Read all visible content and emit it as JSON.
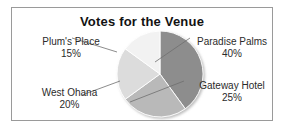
{
  "chart_data": {
    "type": "pie",
    "title": "Votes for the Venue",
    "xlabel": "",
    "ylabel": "",
    "legend_position": "none",
    "grid": false,
    "categories": [
      "Paradise Palms",
      "Gateway Hotel",
      "West Ohana",
      "Plum's Place"
    ],
    "values": [
      40,
      25,
      20,
      15
    ],
    "value_unit": "%",
    "start_angle_deg": 0,
    "direction": "clockwise",
    "slices": [
      {
        "name": "Paradise Palms",
        "value": 40,
        "value_text": "40%",
        "color": "#8d8d8d",
        "start_deg": 0,
        "end_deg": 144
      },
      {
        "name": "Gateway Hotel",
        "value": 25,
        "value_text": "25%",
        "color": "#b9b9b9",
        "start_deg": 144,
        "end_deg": 234
      },
      {
        "name": "West Ohana",
        "value": 20,
        "value_text": "20%",
        "color": "#dcdcdc",
        "start_deg": 234,
        "end_deg": 306
      },
      {
        "name": "Plum's Place",
        "value": 15,
        "value_text": "15%",
        "color": "#f2f2f2",
        "start_deg": 306,
        "end_deg": 360
      }
    ]
  },
  "card": {
    "border_color": "#9a9a9a",
    "background": "#ffffff"
  },
  "labels": {
    "plums": {
      "name": "Plum's Place",
      "value": "15%"
    },
    "paradise": {
      "name": "Paradise Palms",
      "value": "40%"
    },
    "west_ohana": {
      "name": "West Ohana",
      "value": "20%"
    },
    "gateway": {
      "name": "Gateway Hotel",
      "value": "25%"
    }
  },
  "colors": {
    "title_text": "#121212",
    "label_text": "#2b2b2b",
    "leader_line": "#6e6e6e",
    "slice_outline": "#ffffff"
  }
}
